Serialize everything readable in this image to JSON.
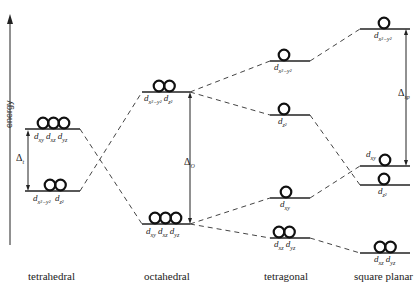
{
  "axis": {
    "label": "energy"
  },
  "geometries": [
    {
      "name": "tetrahedral",
      "levels": [
        {
          "label_main": "d",
          "label_sub": "xy",
          "label2": "d",
          "label2_sub": "xz",
          "label3": "d",
          "label3_sub": "yz",
          "electrons": 3
        },
        {
          "label_main": "d",
          "label_sub": "x²−y²",
          "label2": "d",
          "label2_sub": "z²",
          "electrons": 2
        }
      ],
      "splitting": {
        "symbol": "Δ",
        "sub": "t"
      }
    },
    {
      "name": "octahedral",
      "levels": [
        {
          "label_main": "d",
          "label_sub": "x²−y²",
          "label2": "d",
          "label2_sub": "z²",
          "electrons": 2
        },
        {
          "label_main": "d",
          "label_sub": "xy",
          "label2": "d",
          "label2_sub": "xz",
          "label3": "d",
          "label3_sub": "yz",
          "electrons": 3
        }
      ],
      "splitting": {
        "symbol": "Δ",
        "sub": "O"
      }
    },
    {
      "name": "tetragonal",
      "levels": [
        {
          "label_main": "d",
          "label_sub": "x²−y²",
          "electrons": 1
        },
        {
          "label_main": "d",
          "label_sub": "z²",
          "electrons": 1
        },
        {
          "label_main": "d",
          "label_sub": "xy",
          "electrons": 1
        },
        {
          "label_main": "d",
          "label_sub": "xz",
          "label2": "d",
          "label2_sub": "yz",
          "electrons": 2
        }
      ]
    },
    {
      "name": "square planar",
      "levels": [
        {
          "label_main": "d",
          "label_sub": "x²−y²",
          "electrons": 1
        },
        {
          "label_main": "d",
          "label_sub": "xy",
          "electrons": 1
        },
        {
          "label_main": "d",
          "label_sub": "z²",
          "electrons": 1
        },
        {
          "label_main": "d",
          "label_sub": "xz",
          "label2": "d",
          "label2_sub": "yz",
          "electrons": 2
        }
      ],
      "splitting": {
        "symbol": "Δ",
        "sub": "sp"
      }
    }
  ]
}
